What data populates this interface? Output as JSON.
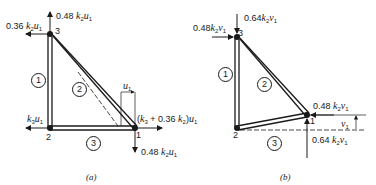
{
  "figure_a": {
    "caption": "(a)",
    "nodes": [
      {
        "id": "1",
        "label": "1"
      },
      {
        "id": "2",
        "label": "2"
      },
      {
        "id": "3",
        "label": "3"
      }
    ],
    "members": [
      {
        "label": "1"
      },
      {
        "label": "2"
      },
      {
        "label": "3"
      }
    ],
    "forces": {
      "node3_up": "0.48 k2u1",
      "node3_left": "0.36 k2u1",
      "node2_left": "k3u1",
      "node1_right": "(k3 + 0.36 k2)u1",
      "node1_down": "0.48 k2u1"
    },
    "displacement": "u1"
  },
  "figure_b": {
    "caption": "(b)",
    "nodes": [
      {
        "id": "1",
        "label": "1"
      },
      {
        "id": "2",
        "label": "2"
      },
      {
        "id": "3",
        "label": "3"
      }
    ],
    "members": [
      {
        "label": "1"
      },
      {
        "label": "2"
      },
      {
        "label": "3"
      }
    ],
    "forces": {
      "node3_down": "0.64k2v1",
      "node3_right": "0.48k2v1",
      "node1_left": "0.48 k2v1",
      "node1_up": "0.64 k2v1"
    },
    "displacement": "v1"
  }
}
